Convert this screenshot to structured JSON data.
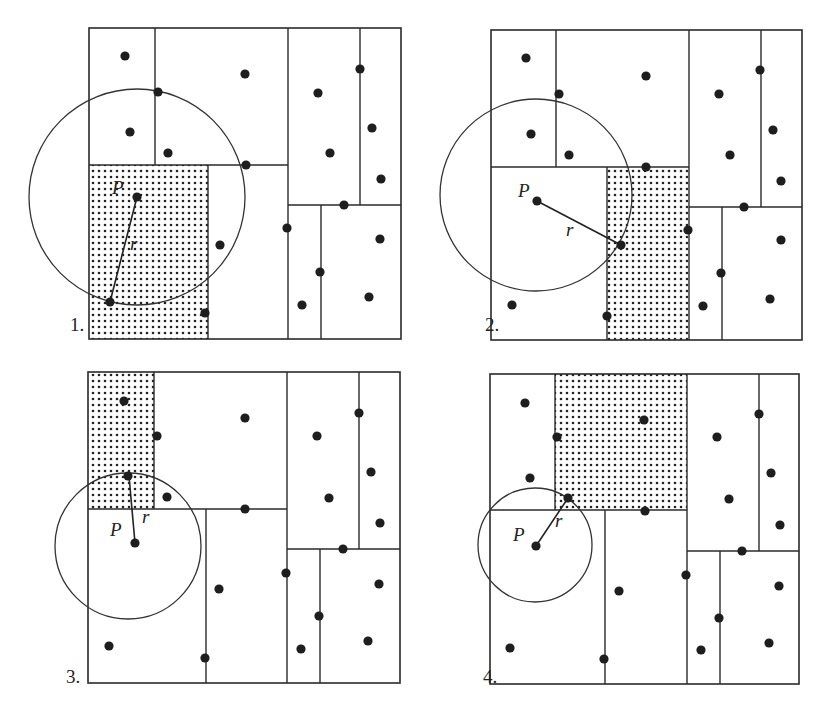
{
  "figure": {
    "panels": [
      {
        "label": "1.",
        "label_pos": [
          70,
          331
        ],
        "box": [
          89,
          28,
          401,
          339
        ],
        "shaded": [
          89,
          165,
          208,
          339
        ],
        "lines": [
          [
            155,
            28,
            155,
            165
          ],
          [
            288,
            28,
            288,
            339
          ],
          [
            89,
            165,
            288,
            165
          ],
          [
            208,
            165,
            208,
            339
          ],
          [
            288,
            205,
            401,
            205
          ],
          [
            360,
            28,
            360,
            205
          ],
          [
            321,
            205,
            321,
            339
          ]
        ],
        "points": [
          [
            125,
            56
          ],
          [
            245,
            74
          ],
          [
            158,
            92
          ],
          [
            318,
            93
          ],
          [
            130,
            132
          ],
          [
            360,
            69
          ],
          [
            168,
            153
          ],
          [
            372,
            128
          ],
          [
            246,
            165
          ],
          [
            330,
            153
          ],
          [
            381,
            179
          ],
          [
            344,
            205
          ],
          [
            287,
            228
          ],
          [
            220,
            245
          ],
          [
            380,
            239
          ],
          [
            320,
            272
          ],
          [
            369,
            297
          ],
          [
            302,
            305
          ],
          [
            205,
            313
          ],
          [
            110,
            302
          ]
        ],
        "P": [
          137,
          197
        ],
        "P_label": "P",
        "P_label_pos": [
          112,
          194
        ],
        "r_end": [
          110,
          302
        ],
        "r_label": "r",
        "r_label_pos": [
          130,
          250
        ],
        "circle": [
          137,
          197,
          108
        ]
      },
      {
        "label": "2.",
        "label_pos": [
          485,
          331
        ],
        "box": [
          491,
          30,
          802,
          340
        ],
        "shaded": [
          607,
          167,
          688,
          340
        ],
        "lines": [
          [
            556,
            30,
            556,
            167
          ],
          [
            689,
            30,
            689,
            340
          ],
          [
            491,
            167,
            689,
            167
          ],
          [
            607,
            167,
            607,
            340
          ],
          [
            689,
            207,
            802,
            207
          ],
          [
            761,
            30,
            761,
            207
          ],
          [
            722,
            207,
            722,
            340
          ]
        ],
        "points": [
          [
            526,
            58
          ],
          [
            646,
            76
          ],
          [
            559,
            94
          ],
          [
            719,
            94
          ],
          [
            531,
            134
          ],
          [
            760,
            70
          ],
          [
            569,
            155
          ],
          [
            773,
            130
          ],
          [
            646,
            167
          ],
          [
            730,
            155
          ],
          [
            781,
            181
          ],
          [
            744,
            207
          ],
          [
            688,
            230
          ],
          [
            621,
            245
          ],
          [
            781,
            240
          ],
          [
            721,
            273
          ],
          [
            770,
            299
          ],
          [
            703,
            306
          ],
          [
            607,
            316
          ],
          [
            512,
            305
          ]
        ],
        "P": [
          537,
          201
        ],
        "P_label": "P",
        "P_label_pos": [
          518,
          197
        ],
        "r_end": [
          621,
          245
        ],
        "r_label": "r",
        "r_label_pos": [
          566,
          236
        ],
        "circle": [
          536,
          195,
          96
        ]
      },
      {
        "label": "3.",
        "label_pos": [
          66,
          683
        ],
        "box": [
          88,
          372,
          400,
          683
        ],
        "shaded": [
          88,
          372,
          154,
          509
        ],
        "lines": [
          [
            154,
            372,
            154,
            509
          ],
          [
            287,
            372,
            287,
            683
          ],
          [
            88,
            509,
            287,
            509
          ],
          [
            206,
            509,
            206,
            683
          ],
          [
            287,
            549,
            400,
            549
          ],
          [
            359,
            372,
            359,
            549
          ],
          [
            320,
            549,
            320,
            683
          ]
        ],
        "points": [
          [
            124,
            401
          ],
          [
            245,
            418
          ],
          [
            157,
            436
          ],
          [
            317,
            436
          ],
          [
            128,
            476
          ],
          [
            359,
            413
          ],
          [
            167,
            497
          ],
          [
            371,
            472
          ],
          [
            245,
            509
          ],
          [
            329,
            498
          ],
          [
            380,
            523
          ],
          [
            343,
            549
          ],
          [
            286,
            573
          ],
          [
            219,
            589
          ],
          [
            379,
            584
          ],
          [
            319,
            616
          ],
          [
            368,
            641
          ],
          [
            301,
            649
          ],
          [
            205,
            658
          ],
          [
            109,
            646
          ]
        ],
        "P": [
          135,
          543
        ],
        "P_label": "P",
        "P_label_pos": [
          110,
          536
        ],
        "r_end": [
          129,
          476
        ],
        "r_label": "r",
        "r_label_pos": [
          142,
          523
        ],
        "circle": [
          128,
          546,
          73
        ]
      },
      {
        "label": "4.",
        "label_pos": [
          483,
          683
        ],
        "box": [
          490,
          374,
          799,
          684
        ],
        "shaded": [
          555,
          374,
          687,
          510
        ],
        "lines": [
          [
            555,
            374,
            555,
            510
          ],
          [
            687,
            374,
            687,
            684
          ],
          [
            490,
            510,
            687,
            510
          ],
          [
            605,
            510,
            605,
            684
          ],
          [
            687,
            551,
            799,
            551
          ],
          [
            759,
            374,
            759,
            551
          ],
          [
            720,
            551,
            720,
            684
          ]
        ],
        "points": [
          [
            525,
            403
          ],
          [
            644,
            420
          ],
          [
            557,
            437
          ],
          [
            717,
            437
          ],
          [
            530,
            478
          ],
          [
            759,
            414
          ],
          [
            568,
            498
          ],
          [
            771,
            473
          ],
          [
            645,
            511
          ],
          [
            729,
            499
          ],
          [
            780,
            525
          ],
          [
            742,
            551
          ],
          [
            686,
            575
          ],
          [
            619,
            591
          ],
          [
            779,
            586
          ],
          [
            719,
            618
          ],
          [
            769,
            643
          ],
          [
            701,
            650
          ],
          [
            604,
            659
          ],
          [
            510,
            648
          ]
        ],
        "P": [
          536,
          546
        ],
        "P_label": "P",
        "P_label_pos": [
          513,
          541
        ],
        "r_end": [
          568,
          498
        ],
        "r_label": "r",
        "r_label_pos": [
          555,
          527
        ],
        "circle": [
          535,
          545,
          57
        ]
      }
    ],
    "colors": {
      "ink": "#222222",
      "background": "#ffffff"
    }
  }
}
